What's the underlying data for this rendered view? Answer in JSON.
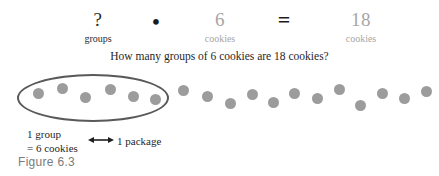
{
  "equation": {
    "terms": [
      {
        "value": "?",
        "label": "groups",
        "tone": "dark"
      },
      {
        "value": "6",
        "label": "cookies",
        "tone": "gray"
      },
      {
        "value": "18",
        "label": "cookies",
        "tone": "gray"
      }
    ],
    "operators": {
      "times": "•",
      "equals": "="
    }
  },
  "question": "How many groups of 6 cookies are 18 cookies?",
  "dot_field": {
    "dot_color": "#9c9c9c",
    "ellipse_color": "#595959",
    "total_dots": 18,
    "grouped_dots": 6,
    "dots": [
      {
        "x": 33,
        "y": 18
      },
      {
        "x": 57,
        "y": 13
      },
      {
        "x": 80,
        "y": 22
      },
      {
        "x": 105,
        "y": 14
      },
      {
        "x": 128,
        "y": 21
      },
      {
        "x": 150,
        "y": 24
      },
      {
        "x": 178,
        "y": 15
      },
      {
        "x": 202,
        "y": 21
      },
      {
        "x": 225,
        "y": 28
      },
      {
        "x": 247,
        "y": 19
      },
      {
        "x": 268,
        "y": 27
      },
      {
        "x": 289,
        "y": 18
      },
      {
        "x": 312,
        "y": 23
      },
      {
        "x": 334,
        "y": 14
      },
      {
        "x": 355,
        "y": 30
      },
      {
        "x": 377,
        "y": 18
      },
      {
        "x": 399,
        "y": 23
      },
      {
        "x": 421,
        "y": 16
      }
    ]
  },
  "annotations": {
    "group_note_line1": "1 group",
    "group_note_line2": "= 6 cookies",
    "package_note": "1 package",
    "arrow_icon": "double-headed-arrow"
  },
  "caption": "Figure 6.3"
}
